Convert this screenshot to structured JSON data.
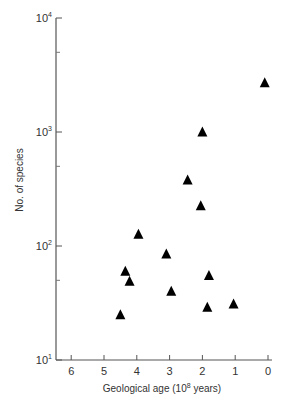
{
  "chart_data": {
    "type": "scatter",
    "title": "",
    "xlabel": "Geological age (10^8 years)",
    "xlabel_parts": {
      "main": "Geological age (10",
      "sup": "8",
      "tail": " years)"
    },
    "ylabel": "No. of species",
    "xlim": [
      6.5,
      0
    ],
    "x_reversed": true,
    "ylim": [
      10,
      10000
    ],
    "yscale": "log",
    "grid": false,
    "legend": null,
    "marker": "filled-triangle",
    "marker_color": "#000000",
    "x_ticks": [
      6,
      5,
      4,
      3,
      2,
      1,
      0
    ],
    "x_tick_labels": [
      "6",
      "5",
      "4",
      "3",
      "2",
      "1",
      "0"
    ],
    "y_ticks": [
      10,
      100,
      1000,
      10000
    ],
    "y_tick_labels": [
      {
        "base": "10",
        "exp": "1"
      },
      {
        "base": "10",
        "exp": "2"
      },
      {
        "base": "10",
        "exp": "3"
      },
      {
        "base": "10",
        "exp": "4"
      }
    ],
    "y_minor_ticks": [
      50,
      500,
      5000
    ],
    "points": [
      {
        "x": 0.1,
        "y": 2700
      },
      {
        "x": 2.0,
        "y": 1000
      },
      {
        "x": 2.45,
        "y": 380
      },
      {
        "x": 2.05,
        "y": 225
      },
      {
        "x": 3.95,
        "y": 127
      },
      {
        "x": 3.1,
        "y": 85
      },
      {
        "x": 4.35,
        "y": 60
      },
      {
        "x": 4.22,
        "y": 49
      },
      {
        "x": 1.8,
        "y": 55
      },
      {
        "x": 2.95,
        "y": 40
      },
      {
        "x": 1.85,
        "y": 29
      },
      {
        "x": 1.05,
        "y": 31
      },
      {
        "x": 4.5,
        "y": 25
      }
    ]
  }
}
